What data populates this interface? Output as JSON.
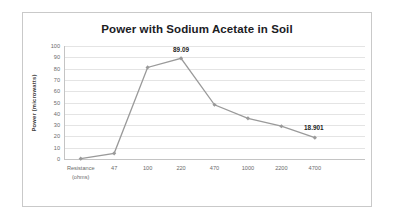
{
  "chart_data": {
    "type": "line",
    "title": "Power with Sodium Acetate in Soil",
    "xlabel": "Resistance (ohms)",
    "ylabel": "Power (microwatts)",
    "categories": [
      "Resistance\n(ohms)",
      "47",
      "100",
      "220",
      "470",
      "1000",
      "2200",
      "4700"
    ],
    "category_labels": [
      {
        "line1": "Resistance",
        "line2": "(ohms)"
      },
      {
        "line1": "47",
        "line2": ""
      },
      {
        "line1": "100",
        "line2": ""
      },
      {
        "line1": "220",
        "line2": ""
      },
      {
        "line1": "470",
        "line2": ""
      },
      {
        "line1": "1000",
        "line2": ""
      },
      {
        "line1": "2200",
        "line2": ""
      },
      {
        "line1": "4700",
        "line2": ""
      }
    ],
    "values": [
      0.3,
      5.0,
      81.0,
      89.09,
      48.0,
      36.0,
      29.0,
      18.901
    ],
    "point_labels": [
      null,
      null,
      null,
      "89.09",
      null,
      null,
      null,
      "18.901"
    ],
    "ylim": [
      0,
      100
    ],
    "yticks": [
      0,
      10,
      20,
      30,
      40,
      50,
      60,
      70,
      80,
      90,
      100
    ],
    "ytick_labels": [
      "0",
      "10",
      "20",
      "30",
      "40",
      "50",
      "60",
      "70",
      "80",
      "90",
      "100"
    ],
    "grid": true,
    "legend": false,
    "series_color": "#9a9a9a",
    "marker": "diamond",
    "plot_background": "#ffffff",
    "gridline_color": "#e4e4e4",
    "title_color": "#20201f"
  }
}
